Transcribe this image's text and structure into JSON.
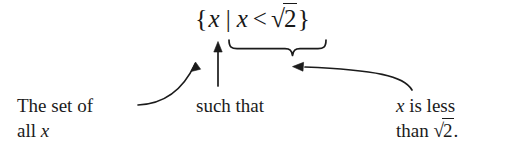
{
  "figure": {
    "background_color": "#ffffff",
    "ink_color": "#1b1b1b"
  },
  "expression": {
    "full_text": "{x | x < √2}",
    "open_brace": "{",
    "element_variable": "x",
    "separator_bar": "|",
    "condition_variable": "x",
    "relation": "<",
    "radical_sign": "√",
    "radicand": "2",
    "close_brace": "}"
  },
  "annotations": [
    {
      "id": "set-of-all-x",
      "line1": "The set of",
      "line2_prefix": "all ",
      "line2_variable": "x",
      "connector": "curved-arrow",
      "points_to": "element_variable"
    },
    {
      "id": "such-that",
      "line1": "such that",
      "line2_prefix": "",
      "line2_variable": "",
      "connector": "straight-arrow",
      "points_to": "separator_bar"
    },
    {
      "id": "x-is-less-than-sqrt-2",
      "line1_variable": "x",
      "line1_rest": " is less",
      "line2_prefix": "than ",
      "line2_radical_sign": "√",
      "line2_radicand": "2",
      "line2_period": ".",
      "connector": "curved-arrow-with-underbrace",
      "points_to": "condition"
    }
  ]
}
